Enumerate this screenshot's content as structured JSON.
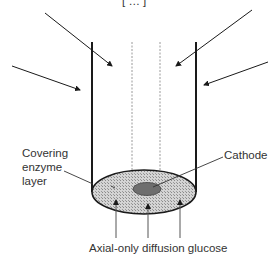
{
  "diagram": {
    "top_fragment": "[  …  ]",
    "labels": {
      "enzyme_layer": [
        "Covering",
        "enzyme",
        "layer"
      ],
      "cathode": "Cathode",
      "bottom": "Axial-only diffusion glucose"
    },
    "colors": {
      "line": "#1a1a1a",
      "disk_fill": "#c8c8c8",
      "cathode_fill": "#6e6e6e",
      "dotted": "#9a9a9a",
      "text": "#333333"
    }
  }
}
